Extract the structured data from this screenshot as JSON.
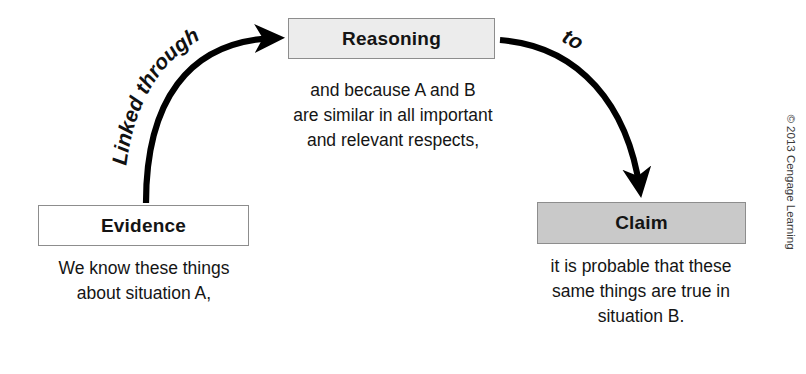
{
  "diagram": {
    "nodes": {
      "evidence": {
        "label": "Evidence",
        "caption_lines": [
          "We know these things",
          "about situation A,"
        ],
        "fill": "#ffffff",
        "border": "#8d8d8d"
      },
      "reasoning": {
        "label": "Reasoning",
        "caption_lines": [
          "and because A and B",
          "are similar in all important",
          "and relevant respects,"
        ],
        "fill": "#ececec",
        "border": "#8d8d8d"
      },
      "claim": {
        "label": "Claim",
        "caption_lines": [
          "it is probable that these",
          "same things are true in",
          "situation B."
        ],
        "fill": "#c9c9c9",
        "border": "#8d8d8d"
      }
    },
    "connectors": [
      {
        "id": "evidence-to-reasoning",
        "label": "Linked through",
        "from": "evidence",
        "to": "reasoning",
        "style": "curved-arrow",
        "color": "#000000"
      },
      {
        "id": "reasoning-to-claim",
        "label": "to",
        "from": "reasoning",
        "to": "claim",
        "style": "curved-arrow",
        "color": "#000000"
      }
    ]
  },
  "footer": {
    "copyright": "© 2013 Cengage Learning"
  }
}
